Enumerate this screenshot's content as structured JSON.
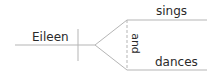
{
  "diagram": {
    "type": "sentence-diagram",
    "subject": "Eileen",
    "conjunction": "and",
    "predicates": [
      "sings",
      "dances"
    ],
    "line_color": "#b5b5b5",
    "text_color": "#2a2a2a"
  }
}
